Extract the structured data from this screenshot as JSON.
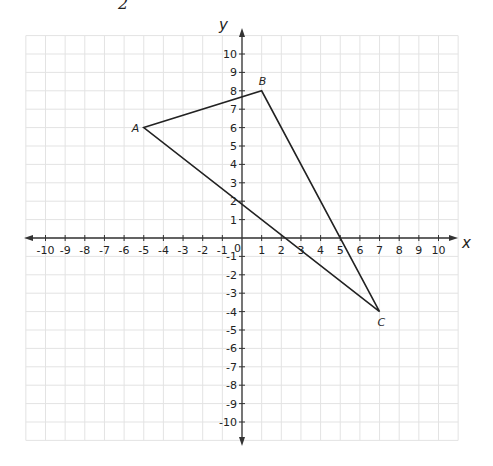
{
  "header_fragment": "2",
  "axes": {
    "x_label": "x",
    "y_label": "y",
    "origin_label": "0",
    "x_ticks": [
      -10,
      -9,
      -8,
      -7,
      -6,
      -5,
      -4,
      -3,
      -2,
      -1,
      1,
      2,
      3,
      4,
      5,
      6,
      7,
      8,
      9,
      10
    ],
    "y_ticks": [
      10,
      9,
      8,
      7,
      6,
      5,
      4,
      3,
      2,
      1,
      -1,
      -2,
      -3,
      -4,
      -5,
      -6,
      -7,
      -8,
      -9,
      -10
    ],
    "range": [
      -11,
      11
    ]
  },
  "points": [
    {
      "label": "A",
      "x": -5,
      "y": 6
    },
    {
      "label": "B",
      "x": 1,
      "y": 8
    },
    {
      "label": "C",
      "x": 7,
      "y": -4
    }
  ],
  "colors": {
    "grid": "#e3e3e3",
    "axis": "#333333",
    "triangle": "#222222"
  }
}
